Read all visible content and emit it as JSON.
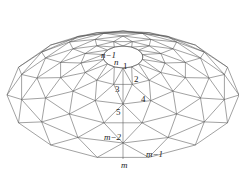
{
  "figure": {
    "colors": {
      "line": "#555555",
      "background": "#ffffff",
      "text": "#222222"
    }
  },
  "geometry": {
    "center": [
      123,
      57
    ],
    "opening": {
      "rx": 20,
      "ry": 11
    },
    "sectors": 14,
    "rings": [
      {
        "rx": 20,
        "ry": 11,
        "dy": 0
      },
      {
        "rx": 42,
        "ry": 22,
        "dy": 6
      },
      {
        "rx": 64,
        "ry": 34,
        "dy": 13
      },
      {
        "rx": 86,
        "ry": 46,
        "dy": 21
      },
      {
        "rx": 104,
        "ry": 56,
        "dy": 30
      },
      {
        "rx": 116,
        "ry": 64,
        "dy": 38
      }
    ]
  },
  "labels": [
    {
      "text": "n−1",
      "x": 101,
      "y": 51,
      "italic": true
    },
    {
      "text": "n",
      "x": 114,
      "y": 58,
      "italic": true
    },
    {
      "text": "1",
      "x": 123,
      "y": 62,
      "italic": false
    },
    {
      "text": "2",
      "x": 134,
      "y": 75,
      "italic": false
    },
    {
      "text": "3",
      "x": 115,
      "y": 85,
      "italic": false
    },
    {
      "text": "4",
      "x": 141,
      "y": 95,
      "italic": false
    },
    {
      "text": "5",
      "x": 116,
      "y": 108,
      "italic": false
    },
    {
      "text": "m−2",
      "x": 104,
      "y": 133,
      "italic": true
    },
    {
      "text": "m−1",
      "x": 146,
      "y": 150,
      "italic": true
    },
    {
      "text": "m",
      "x": 121,
      "y": 161,
      "italic": true
    }
  ]
}
